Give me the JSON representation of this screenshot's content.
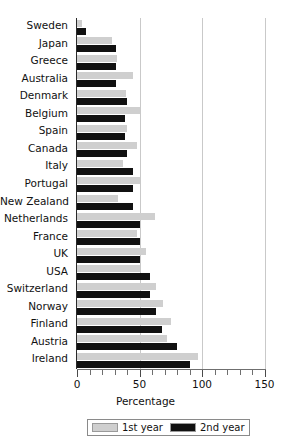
{
  "chart_data": {
    "type": "bar",
    "orientation": "horizontal",
    "title": "",
    "xlabel": "Percentage",
    "ylabel": "",
    "xlim": [
      0,
      150
    ],
    "ylim": null,
    "grid": true,
    "legend_position": "bottom",
    "xticks": [
      0,
      50,
      100,
      150
    ],
    "xtick_labels": [
      "0",
      "50",
      "100",
      "150"
    ],
    "xtick_minor_step": 10,
    "categories": [
      "Sweden",
      "Japan",
      "Greece",
      "Australia",
      "Denmark",
      "Belgium",
      "Spain",
      "Canada",
      "Italy",
      "Portugal",
      "New Zealand",
      "Netherlands",
      "France",
      "UK",
      "USA",
      "Switzerland",
      "Norway",
      "Finland",
      "Austria",
      "Ireland"
    ],
    "series": [
      {
        "name": "1st year",
        "color": "#cfcfcf",
        "values": [
          4,
          28,
          32,
          45,
          39,
          50,
          40,
          48,
          37,
          50,
          33,
          62,
          48,
          55,
          50,
          63,
          69,
          75,
          72,
          97
        ]
      },
      {
        "name": "2nd year",
        "color": "#111111",
        "values": [
          7,
          31,
          31,
          31,
          40,
          38,
          38,
          40,
          45,
          45,
          45,
          50,
          50,
          50,
          58,
          58,
          63,
          68,
          80,
          90
        ]
      }
    ]
  },
  "axis": {
    "x_title": "Percentage",
    "tick_labels": [
      "0",
      "50",
      "100",
      "150"
    ]
  },
  "legend": {
    "entries": [
      {
        "label": "1st year",
        "color": "#cfcfcf"
      },
      {
        "label": "2nd year",
        "color": "#111111"
      }
    ]
  }
}
